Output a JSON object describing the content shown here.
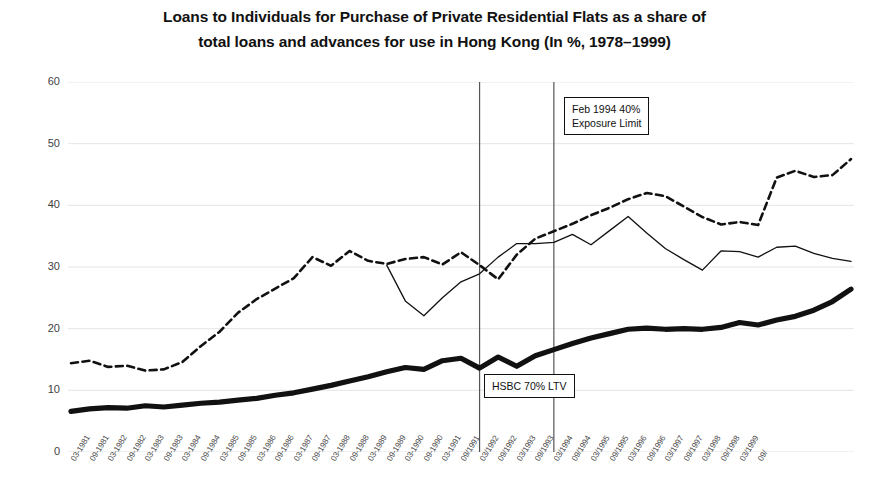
{
  "title": {
    "line1": "Loans to Individuals for Purchase of Private Residential Flats as a share of",
    "line2": "total loans and advances for use in Hong Kong (In %, 1978–1999)"
  },
  "annotations": [
    {
      "id": "exposure",
      "line1": "Feb 1994 40%",
      "line2": "Exposure Limit",
      "x_category": "03/1994"
    },
    {
      "id": "ltv",
      "line1": "HSBC 70% LTV",
      "line2": "",
      "x_category": "03/1992"
    }
  ],
  "colors": {
    "axis_text": "#3f3f3f",
    "grid": "#e2e2e2",
    "series_thick": "#111111",
    "series_thin": "#111111",
    "series_dashed": "#111111",
    "event_line": "#555555",
    "background": "#ffffff"
  },
  "chart_data": {
    "type": "line",
    "title": "Loans to Individuals for Purchase of Private Residential Flats as a share of total loans and advances for use in Hong Kong (In %, 1978–1999)",
    "xlabel": "",
    "ylabel": "",
    "ylim": [
      0,
      60
    ],
    "yticks": [
      0,
      10,
      20,
      30,
      40,
      50,
      60
    ],
    "grid": true,
    "legend": "none",
    "categories": [
      "03-1981",
      "09-1981",
      "03-1982",
      "09-1982",
      "03-1983",
      "09-1983",
      "03-1984",
      "09-1984",
      "03-1985",
      "09-1985",
      "03-1986",
      "09-1986",
      "03-1987",
      "09-1987",
      "03-1988",
      "09-1988",
      "03-1989",
      "09-1989",
      "03-1990",
      "09-1990",
      "03-1991",
      "09/1991",
      "03/1992",
      "09/1992",
      "03/1993",
      "09/1993",
      "03/1994",
      "09/1994",
      "03/1995",
      "09/1995",
      "03/1996",
      "09/1996",
      "03/1997",
      "09/1997",
      "03/1998",
      "09/1998",
      "03/1999",
      "09/"
    ],
    "series": [
      {
        "name": "thick-solid",
        "style": "thick-solid",
        "values": [
          6.6,
          7.0,
          7.2,
          7.1,
          7.5,
          7.3,
          7.6,
          7.9,
          8.1,
          8.4,
          8.7,
          9.2,
          9.6,
          10.2,
          10.8,
          11.5,
          12.2,
          13.0,
          13.7,
          13.4,
          14.8,
          15.2,
          13.6,
          15.4,
          13.9,
          15.6,
          16.6,
          17.6,
          18.5,
          19.2,
          19.9,
          20.1,
          19.9,
          20.0,
          19.9,
          20.2,
          21.0,
          20.6
        ]
      },
      {
        "name": "thin-solid",
        "style": "thin-solid",
        "values": [
          null,
          null,
          null,
          null,
          null,
          null,
          null,
          null,
          null,
          null,
          null,
          null,
          null,
          null,
          null,
          null,
          null,
          30.3,
          24.5,
          22.1,
          25.0,
          27.6,
          28.9,
          31.6,
          33.8,
          33.8,
          34.0,
          35.3,
          33.6,
          35.9,
          38.2,
          35.5,
          33.0,
          31.2,
          29.5,
          32.6,
          32.5,
          31.6
        ]
      },
      {
        "name": "dashed",
        "style": "dashed",
        "values": [
          14.4,
          14.8,
          13.8,
          14.0,
          13.2,
          13.4,
          14.6,
          17.2,
          19.5,
          22.6,
          24.8,
          26.5,
          28.2,
          31.6,
          30.2,
          32.6,
          31.0,
          30.5,
          31.3,
          31.6,
          30.4,
          32.4,
          30.3,
          28.0,
          32.0,
          34.6,
          35.8,
          37.0,
          38.4,
          39.6,
          41.0,
          42.0,
          41.5,
          39.8,
          38.1,
          36.9,
          37.3,
          36.8
        ]
      }
    ],
    "event_lines": [
      {
        "label": "HSBC 70% LTV",
        "x_category": "03/1992"
      },
      {
        "label": "Feb 1994 40% Exposure Limit",
        "x_category": "03/1994"
      }
    ]
  },
  "chart_tail": {
    "note": "series continue past 09/ with values extended below",
    "thick_tail": [
      21.4,
      22.0,
      23.0,
      24.4,
      26.4
    ],
    "thin_tail": [
      33.2,
      33.4,
      32.2,
      31.4,
      30.9
    ],
    "dashed_tail": [
      44.5,
      45.6,
      44.6,
      44.9,
      47.5
    ]
  }
}
